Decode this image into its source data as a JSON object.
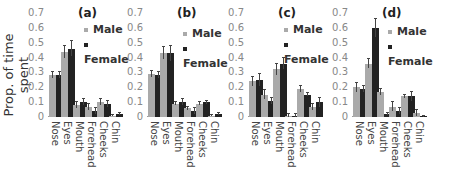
{
  "chart_data": [
    {
      "type": "bar",
      "title": "(a)",
      "ylabel": "Prop. of time spent",
      "xlabel": "",
      "ylim": [
        0,
        0.7
      ],
      "yticks": [
        "0",
        "0.1",
        "0.2",
        "0.3",
        "0.4",
        "0.5",
        "0.6",
        "0.7"
      ],
      "categories": [
        "Nose",
        "Eyes",
        "Mouth",
        "Forehead",
        "Cheeks",
        "Chin"
      ],
      "legend": [
        "Male",
        "Female"
      ],
      "series": [
        {
          "name": "Male",
          "color": "#aaaaaa",
          "values": [
            0.28,
            0.44,
            0.08,
            0.07,
            0.1,
            0.01
          ],
          "errors": [
            0.02,
            0.04,
            0.02,
            0.02,
            0.02,
            0.005
          ]
        },
        {
          "name": "Female",
          "color": "#222222",
          "values": [
            0.28,
            0.46,
            0.1,
            0.04,
            0.09,
            0.02
          ],
          "errors": [
            0.02,
            0.05,
            0.02,
            0.02,
            0.02,
            0.005
          ]
        }
      ]
    },
    {
      "type": "bar",
      "title": "(b)",
      "ylim": [
        0,
        0.7
      ],
      "yticks": [
        "0",
        "0.1",
        "0.2",
        "0.3",
        "0.4",
        "0.5",
        "0.6",
        "0.7"
      ],
      "categories": [
        "Nose",
        "Eyes",
        "Mouth",
        "Forehead",
        "Cheeks",
        "Chin"
      ],
      "legend": [
        "Male",
        "Female"
      ],
      "series": [
        {
          "name": "Male",
          "color": "#aaaaaa",
          "values": [
            0.29,
            0.43,
            0.09,
            0.06,
            0.09,
            0.01
          ],
          "errors": [
            0.02,
            0.04,
            0.01,
            0.01,
            0.01,
            0.005
          ]
        },
        {
          "name": "Female",
          "color": "#222222",
          "values": [
            0.28,
            0.43,
            0.1,
            0.04,
            0.1,
            0.02
          ],
          "errors": [
            0.02,
            0.05,
            0.02,
            0.02,
            0.01,
            0.005
          ]
        }
      ]
    },
    {
      "type": "bar",
      "title": "(c)",
      "ylim": [
        0,
        0.7
      ],
      "yticks": [
        "0",
        "0.1",
        "0.2",
        "0.3",
        "0.4",
        "0.5",
        "0.6",
        "0.7"
      ],
      "categories": [
        "Nose",
        "Eyes",
        "Mouth",
        "Forehead",
        "Cheeks",
        "Chin"
      ],
      "legend": [
        "Male",
        "Female"
      ],
      "series": [
        {
          "name": "Male",
          "color": "#aaaaaa",
          "values": [
            0.24,
            0.15,
            0.32,
            0.01,
            0.19,
            0.07
          ],
          "errors": [
            0.03,
            0.03,
            0.04,
            0.01,
            0.02,
            0.02
          ]
        },
        {
          "name": "Female",
          "color": "#222222",
          "values": [
            0.25,
            0.11,
            0.36,
            0.01,
            0.15,
            0.1
          ],
          "errors": [
            0.04,
            0.02,
            0.04,
            0.01,
            0.01,
            0.03
          ]
        }
      ]
    },
    {
      "type": "bar",
      "title": "(d)",
      "ylim": [
        0,
        0.7
      ],
      "yticks": [
        "0",
        "0.1",
        "0.2",
        "0.3",
        "0.4",
        "0.5",
        "0.6",
        "0.7"
      ],
      "categories": [
        "Nose",
        "Eyes",
        "Mouth",
        "Forehead",
        "Cheeks",
        "Chin"
      ],
      "legend": [
        "Male",
        "Female"
      ],
      "series": [
        {
          "name": "Male",
          "color": "#aaaaaa",
          "values": [
            0.2,
            0.36,
            0.17,
            0.07,
            0.14,
            0.03
          ],
          "errors": [
            0.03,
            0.03,
            0.02,
            0.03,
            0.01,
            0.02
          ]
        },
        {
          "name": "Female",
          "color": "#222222",
          "values": [
            0.19,
            0.6,
            0.02,
            0.04,
            0.14,
            0.005
          ],
          "errors": [
            0.02,
            0.06,
            0.005,
            0.02,
            0.03,
            0.003
          ]
        }
      ]
    }
  ],
  "ylabel": "Prop. of time spent",
  "panels": [
    {
      "title": "(a)",
      "legend_male": "Male",
      "legend_female": "Female"
    },
    {
      "title": "(b)",
      "legend_male": "Male",
      "legend_female": "Female"
    },
    {
      "title": "(c)",
      "legend_male": "Male",
      "legend_female": "Female"
    },
    {
      "title": "(d)",
      "legend_male": "Male",
      "legend_female": "Female"
    }
  ]
}
